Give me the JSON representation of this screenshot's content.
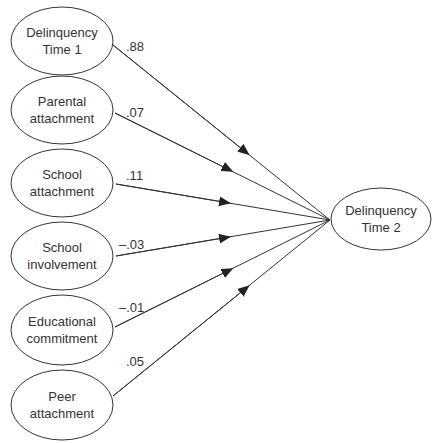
{
  "diagram": {
    "type": "path-model",
    "colors": {
      "stroke": "#333333",
      "text": "#333333",
      "background": "#ffffff"
    },
    "outcome": {
      "line1": "Delinquency",
      "line2": "Time 2"
    },
    "predictors": [
      {
        "line1": "Delinquency",
        "line2": "Time 1",
        "coefficient": ".88"
      },
      {
        "line1": "Parental",
        "line2": "attachment",
        "coefficient": ".07"
      },
      {
        "line1": "School",
        "line2": "attachment",
        "coefficient": ".11"
      },
      {
        "line1": "School",
        "line2": "involvement",
        "coefficient": "–.03"
      },
      {
        "line1": "Educational",
        "line2": "commitment",
        "coefficient": "–.01"
      },
      {
        "line1": "Peer",
        "line2": "attachment",
        "coefficient": ".05"
      }
    ]
  }
}
